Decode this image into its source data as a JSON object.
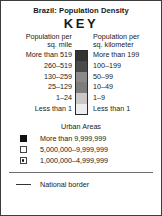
{
  "legend": {
    "title": "Brazil: Population Density",
    "key_word": "KEY",
    "density": {
      "header_left": "Population per\nsq. mile",
      "header_right": "Population per\nsq. kilometer",
      "rows": [
        {
          "per_sq_mile": "More than 519",
          "per_sq_km": "More than 199",
          "color": "#333333"
        },
        {
          "per_sq_mile": "260–519",
          "per_sq_km": "100–199",
          "color": "#4a4a4a"
        },
        {
          "per_sq_mile": "130–259",
          "per_sq_km": "50–99",
          "color": "#8a8a8a"
        },
        {
          "per_sq_mile": "25–129",
          "per_sq_km": "10–49",
          "color": "#7d7d7d"
        },
        {
          "per_sq_mile": "1–24",
          "per_sq_km": "1–9",
          "color": "#c8c8c8"
        },
        {
          "per_sq_mile": "Less than 1",
          "per_sq_km": "Less than 1",
          "color": "#ececec"
        }
      ]
    },
    "urban": {
      "heading": "Urban Areas",
      "rows": [
        {
          "symbol": "filled-square",
          "label": "More than 9,999,999"
        },
        {
          "symbol": "hollow-square",
          "label": "5,000,000–9,999,999"
        },
        {
          "symbol": "dotted-square",
          "label": "1,000,000–4,999,999"
        }
      ]
    },
    "border": {
      "label": "National border"
    }
  }
}
